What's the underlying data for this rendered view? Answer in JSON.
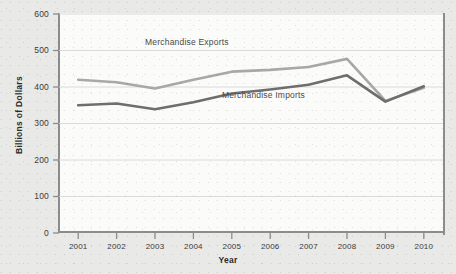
{
  "chart_data": {
    "type": "line",
    "title": "",
    "xlabel": "Year",
    "ylabel": "Billions of Dollars",
    "categories": [
      "2001",
      "2002",
      "2003",
      "2004",
      "2005",
      "2006",
      "2007",
      "2008",
      "2009",
      "2010"
    ],
    "x": [
      2001,
      2002,
      2003,
      2004,
      2005,
      2006,
      2007,
      2008,
      2009,
      2010
    ],
    "ylim": [
      0,
      600
    ],
    "yticks": [
      0,
      100,
      200,
      300,
      400,
      500,
      600
    ],
    "ytick_labels": [
      "0",
      "100",
      "200",
      "300",
      "400",
      "500",
      "600"
    ],
    "grid": true,
    "grid_axis": "y",
    "legend_position": "inline-annotation",
    "series": [
      {
        "name": "Merchandise Exports",
        "color": "#a8a8a8",
        "values": [
          420,
          413,
          396,
          420,
          442,
          447,
          455,
          477,
          362,
          398
        ]
      },
      {
        "name": "Merchandise Imports",
        "color": "#6e6e6e",
        "values": [
          350,
          355,
          339,
          358,
          382,
          393,
          406,
          432,
          360,
          402
        ]
      }
    ],
    "annotations": [
      {
        "text": "Merchandise Exports",
        "x": 2004.2,
        "y": 520
      },
      {
        "text": "Merchandise Imports",
        "x": 2006.2,
        "y": 375
      }
    ]
  },
  "axes": {
    "y_title": "Billions of Dollars",
    "x_title": "Year"
  },
  "colors": {
    "background": "#e9e9e7",
    "plot_background": "#fbfbfa",
    "axis": "#8c8c8c",
    "grid": "#d6d6d4",
    "exports": "#a8a8a8",
    "imports": "#6e6e6e",
    "text": "#3b3b3b"
  }
}
